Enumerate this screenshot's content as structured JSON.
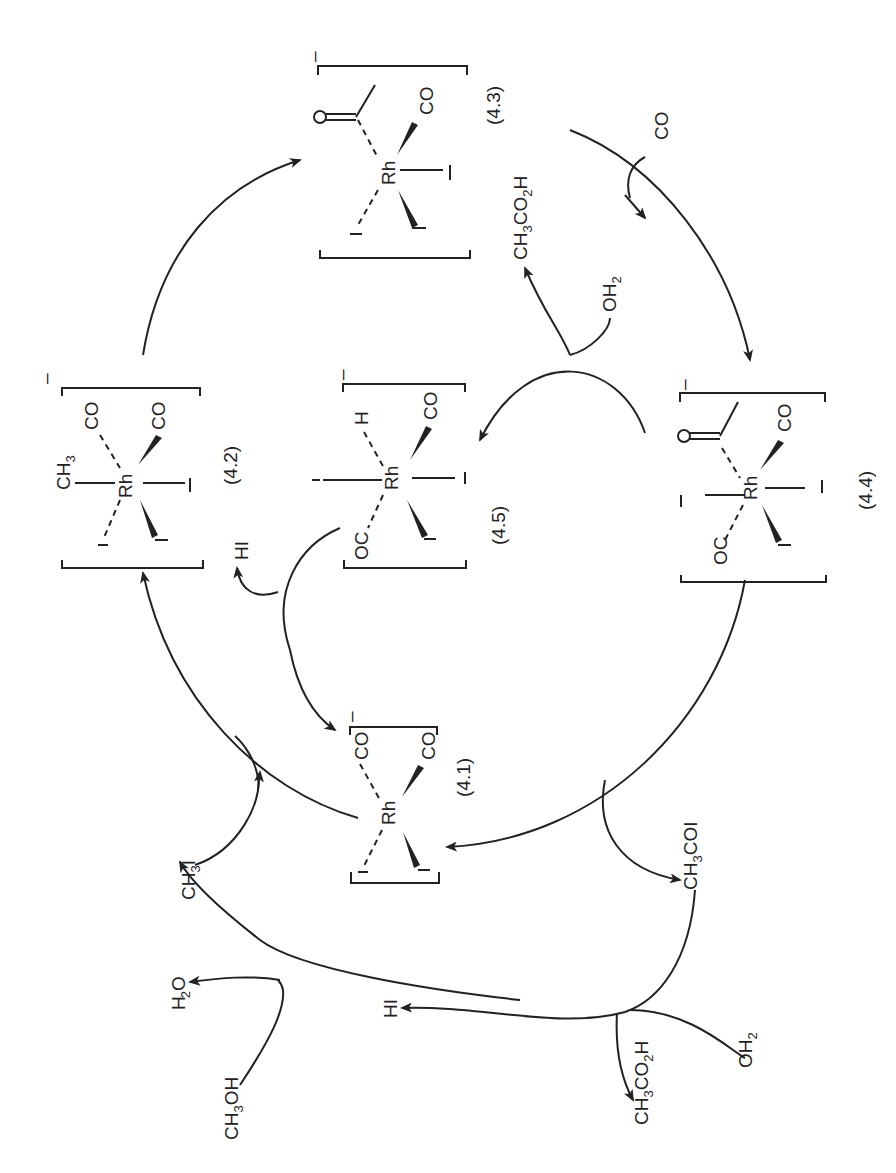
{
  "diagram": {
    "orientation": "rotated 90deg counter-clockwise",
    "colors": {
      "ink": "#222222",
      "background": "#ffffff"
    },
    "complexes": [
      {
        "id": "4.1",
        "label": "(4.1)",
        "charge": "–",
        "metal": "Rh",
        "ligands": [
          "CO",
          "CO",
          "I",
          "I"
        ]
      },
      {
        "id": "4.2",
        "label": "(4.2)",
        "charge": "–",
        "metal": "Rh",
        "ligands": [
          "CH3",
          "CO",
          "CO",
          "I",
          "I",
          "I"
        ]
      },
      {
        "id": "4.3",
        "label": "(4.3)",
        "charge": "–",
        "metal": "Rh",
        "ligands": [
          "C(O)CH3",
          "CO",
          "I",
          "I",
          "I"
        ]
      },
      {
        "id": "4.4",
        "label": "(4.4)",
        "charge": "–",
        "metal": "Rh",
        "ligands": [
          "C(O)CH3",
          "CO",
          "OC",
          "I",
          "I",
          "I"
        ]
      },
      {
        "id": "4.5",
        "label": "(4.5)",
        "charge": "–",
        "metal": "Rh",
        "ligands": [
          "H",
          "CO",
          "OC",
          "I",
          "I",
          "I"
        ]
      }
    ],
    "species": {
      "ch3i": "CH3I",
      "ch3coi": "CH3COI",
      "ch3oh": "CH3OH",
      "h2o": "H2O",
      "hi_outer": "HI",
      "hi_inner": "HI",
      "oh2_outer": "OH2",
      "oh2_inner": "OH2",
      "acid_outer": "CH3CO2H",
      "acid_inner": "CH3CO2H",
      "co_in": "CO"
    },
    "text": {
      "rh": "Rh",
      "co": "CO",
      "oc": "OC",
      "i": "I",
      "h": "H",
      "minus": "–",
      "ch": "CH",
      "three": "3",
      "two": "2",
      "o": "O",
      "oh": "OH",
      "coi": "COI",
      "co2h": "CO",
      "hi": "HI",
      "l41": "(4.1)",
      "l42": "(4.2)",
      "l43": "(4.3)",
      "l44": "(4.4)",
      "l45": "(4.5)"
    }
  }
}
